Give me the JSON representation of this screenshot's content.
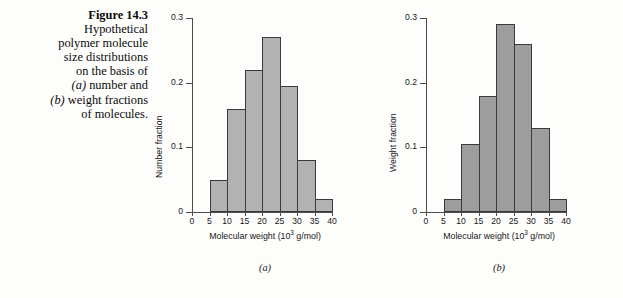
{
  "caption": {
    "figure_number": "Figure 14.3",
    "line1": "Hypothetical",
    "line2": "polymer molecule",
    "line3": "size distributions",
    "line4": "on the basis of",
    "line5_a": "(a)",
    "line5_rest": " number and",
    "line6_b": "(b)",
    "line6_rest": " weight fractions",
    "line7": "of molecules."
  },
  "colors": {
    "bar_fill_a": "#b2b2b2",
    "bar_fill_b": "#9d9d9d",
    "bar_stroke": "#3a3a3a",
    "axis": "#4c4c4c",
    "text": "#171717",
    "background": "#fdfdfc"
  },
  "panel_a": {
    "letter": "(a)",
    "ylabel": "Number fraction",
    "xlabel_main": "Molecular weight (10",
    "xlabel_sup": "3",
    "xlabel_tail": " g/mol)",
    "ytick_labels": [
      "0",
      "0.1",
      "0.2",
      "0.3"
    ],
    "xtick_labels": [
      "0",
      "5",
      "10",
      "15",
      "20",
      "25",
      "30",
      "35",
      "40"
    ]
  },
  "panel_b": {
    "letter": "(b)",
    "ylabel": "Weight fraction",
    "xlabel_main": "Molecular weight (10",
    "xlabel_sup": "3",
    "xlabel_tail": " g/mol)",
    "ytick_labels": [
      "0",
      "0.1",
      "0.2",
      "0.3"
    ],
    "xtick_labels": [
      "0",
      "5",
      "10",
      "15",
      "20",
      "25",
      "30",
      "35",
      "40"
    ]
  },
  "chart_data": [
    {
      "type": "bar",
      "id": "a",
      "title": "(a) number fraction",
      "xlabel": "Molecular weight (10^3 g/mol)",
      "ylabel": "Number fraction",
      "xlim": [
        0,
        40
      ],
      "ylim": [
        0,
        0.3
      ],
      "xticks": [
        0,
        5,
        10,
        15,
        20,
        25,
        30,
        35,
        40
      ],
      "yticks": [
        0,
        0.1,
        0.2,
        0.3
      ],
      "grid": false,
      "legend": null,
      "bin_edges": [
        5,
        10,
        15,
        20,
        25,
        30,
        35,
        40
      ],
      "categories": [
        "5-10",
        "10-15",
        "15-20",
        "20-25",
        "25-30",
        "30-35",
        "35-40"
      ],
      "values": [
        0.05,
        0.16,
        0.22,
        0.27,
        0.195,
        0.08,
        0.02
      ]
    },
    {
      "type": "bar",
      "id": "b",
      "title": "(b) weight fraction",
      "xlabel": "Molecular weight (10^3 g/mol)",
      "ylabel": "Weight fraction",
      "xlim": [
        0,
        40
      ],
      "ylim": [
        0,
        0.3
      ],
      "xticks": [
        0,
        5,
        10,
        15,
        20,
        25,
        30,
        35,
        40
      ],
      "yticks": [
        0,
        0.1,
        0.2,
        0.3
      ],
      "grid": false,
      "legend": null,
      "bin_edges": [
        5,
        10,
        15,
        20,
        25,
        30,
        35,
        40
      ],
      "categories": [
        "5-10",
        "10-15",
        "15-20",
        "20-25",
        "25-30",
        "30-35",
        "35-40"
      ],
      "values": [
        0.02,
        0.105,
        0.18,
        0.29,
        0.26,
        0.13,
        0.02
      ]
    }
  ]
}
